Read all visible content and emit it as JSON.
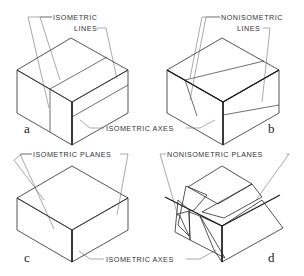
{
  "figure": {
    "colors": {
      "top_face": "#ffffff",
      "left_face": "#e2e2e2",
      "right_face": "#8e8e8e",
      "nonisometric_plane": "#8c8c8c",
      "line": "#2a2a2a",
      "text": "#333333"
    },
    "panels": [
      {
        "letter": "a",
        "callout_top_1": "ISOMETRIC",
        "callout_top_2": "LINES",
        "callout_bottom": "ISOMETRIC AXES"
      },
      {
        "letter": "b",
        "callout_top_1": "NONISOMETRIC",
        "callout_top_2": "LINES"
      },
      {
        "letter": "c",
        "callout_top_1": "ISOMETRIC PLANES",
        "callout_bottom": "ISOMETRIC AXES"
      },
      {
        "letter": "d",
        "callout_top_1": "NONISOMETRIC PLANES"
      }
    ]
  }
}
